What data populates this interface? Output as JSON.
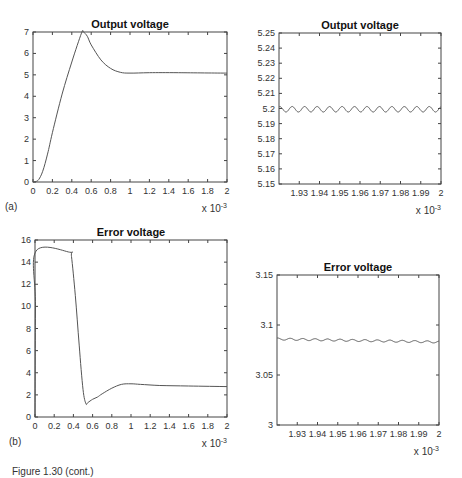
{
  "chart_data": [
    {
      "id": "a-left",
      "type": "line",
      "title": "Output voltage",
      "panel_label": "(a)",
      "xlabel": "",
      "ylabel": "",
      "x_multiplier": "x 10^-3",
      "xlim": [
        0,
        2
      ],
      "ylim": [
        0,
        7
      ],
      "xticks": [
        "0",
        "0.2",
        "0.4",
        "0.6",
        "0.8",
        "1",
        "1.2",
        "1.4",
        "1.6",
        "1.8",
        "2"
      ],
      "yticks": [
        "0",
        "1",
        "2",
        "3",
        "4",
        "5",
        "6",
        "7"
      ],
      "grid": false,
      "series": [
        {
          "name": "Output voltage",
          "x": [
            0,
            0.03,
            0.06,
            0.1,
            0.15,
            0.2,
            0.3,
            0.4,
            0.5,
            0.52,
            0.56,
            0.6,
            0.7,
            0.8,
            0.9,
            1.0,
            1.2,
            1.5,
            2.0
          ],
          "y": [
            0,
            0.02,
            0.12,
            0.5,
            1.3,
            2.3,
            4.1,
            5.6,
            6.95,
            7.0,
            6.8,
            6.4,
            5.7,
            5.3,
            5.12,
            5.08,
            5.1,
            5.1,
            5.08
          ]
        }
      ]
    },
    {
      "id": "a-right",
      "type": "line",
      "title": "Output voltage",
      "x_multiplier": "x 10^-3",
      "xlim": [
        1.92,
        2
      ],
      "ylim": [
        5.15,
        5.25
      ],
      "xticks": [
        "1.93",
        "1.94",
        "1.95",
        "1.96",
        "1.97",
        "1.98",
        "1.99",
        "2"
      ],
      "yticks": [
        "5.15",
        "5.16",
        "5.17",
        "5.18",
        "5.19",
        "5.2",
        "5.21",
        "5.22",
        "5.23",
        "5.24",
        "5.25"
      ],
      "grid": false,
      "series": [
        {
          "name": "Output voltage ripple",
          "mean": 5.1995,
          "amplitude": 0.0018,
          "cycles": 13
        }
      ]
    },
    {
      "id": "b-left",
      "type": "line",
      "title": "Error voltage",
      "panel_label": "(b)",
      "x_multiplier": "x 10^-3",
      "xlim": [
        0,
        2
      ],
      "ylim": [
        0,
        16
      ],
      "xticks": [
        "0",
        "0.2",
        "0.4",
        "0.6",
        "0.8",
        "1",
        "1.2",
        "1.4",
        "1.6",
        "1.8",
        "2"
      ],
      "yticks": [
        "0",
        "2",
        "4",
        "6",
        "8",
        "10",
        "12",
        "14",
        "16"
      ],
      "grid": false,
      "series": [
        {
          "name": "Error voltage",
          "x": [
            0,
            0.005,
            0.01,
            0.36,
            0.38,
            0.42,
            0.46,
            0.5,
            0.53,
            0.55,
            0.6,
            0.65,
            0.7,
            0.8,
            0.9,
            1.0,
            1.1,
            1.3,
            1.6,
            2.0
          ],
          "y": [
            0,
            10,
            15,
            14.9,
            14.5,
            11,
            6.5,
            2.5,
            1.2,
            1.3,
            1.6,
            1.8,
            2.1,
            2.6,
            2.95,
            3.0,
            2.95,
            2.85,
            2.8,
            2.75
          ]
        }
      ]
    },
    {
      "id": "b-right",
      "type": "line",
      "title": "Error voltage",
      "x_multiplier": "x 10^-3",
      "xlim": [
        1.92,
        2
      ],
      "ylim": [
        3.0,
        3.15
      ],
      "xticks": [
        "1.93",
        "1.94",
        "1.95",
        "1.96",
        "1.97",
        "1.98",
        "1.99",
        "2"
      ],
      "yticks": [
        "3",
        "3.05",
        "3.1",
        "3.15"
      ],
      "grid": false,
      "series": [
        {
          "name": "Error voltage ripple",
          "mean_start": 3.086,
          "mean_end": 3.083,
          "amplitude": 0.001,
          "cycles": 13
        }
      ]
    }
  ],
  "caption": "Figure 1.30 (cont.)"
}
